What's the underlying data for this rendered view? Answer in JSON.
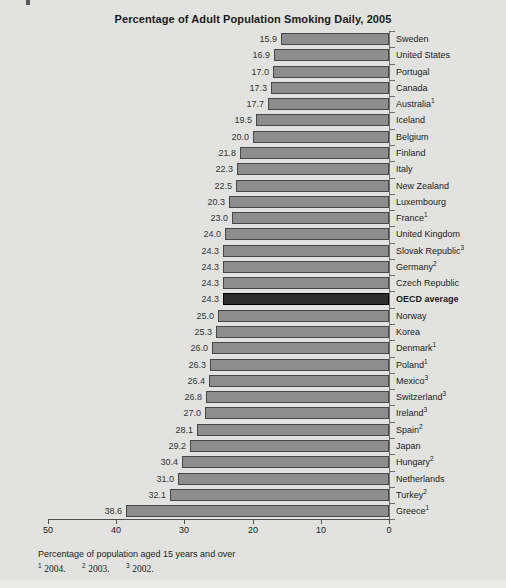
{
  "colors": {
    "background": "#e2e3e0",
    "bar_fill": "#8d8d8d",
    "bar_border": "#474747",
    "highlight_fill": "#2d2d2d",
    "highlight_border": "#000000",
    "axis_line": "#4f4f4f",
    "tick": "#6e6e6e",
    "text": "#1a1a1a",
    "value_text": "#333333",
    "strip": "#ebecea",
    "artifact": "#5a5a5a"
  },
  "footnote_refs": [
    {
      "marker": "1",
      "year": "2004."
    },
    {
      "marker": "2",
      "year": "2003."
    },
    {
      "marker": "3",
      "year": "2002."
    }
  ],
  "chart_data": {
    "type": "bar",
    "orientation": "horizontal",
    "title": "Percentage of Adult Population Smoking Daily, 2005",
    "xlabel": "Percentage of population aged 15 years and over",
    "xlim": [
      0,
      50
    ],
    "x_ticks": [
      50,
      40,
      30,
      20,
      10,
      0
    ],
    "value_axis_note": "zero at right, values increase leftward",
    "legend": "none",
    "grid": "off",
    "rows": [
      {
        "label": "Sweden",
        "sup": "",
        "value": "15.9",
        "bar": 15.9,
        "highlight": false
      },
      {
        "label": "United States",
        "sup": "",
        "value": "16.9",
        "bar": 16.9,
        "highlight": false
      },
      {
        "label": "Portugal",
        "sup": "",
        "value": "17.0",
        "bar": 17.0,
        "highlight": false
      },
      {
        "label": "Canada",
        "sup": "",
        "value": "17.3",
        "bar": 17.3,
        "highlight": false
      },
      {
        "label": "Australia",
        "sup": "1",
        "value": "17.7",
        "bar": 17.7,
        "highlight": false
      },
      {
        "label": "Iceland",
        "sup": "",
        "value": "19.5",
        "bar": 19.5,
        "highlight": false
      },
      {
        "label": "Belgium",
        "sup": "",
        "value": "20.0",
        "bar": 20.0,
        "highlight": false
      },
      {
        "label": "Finland",
        "sup": "",
        "value": "21.8",
        "bar": 21.8,
        "highlight": false
      },
      {
        "label": "Italy",
        "sup": "",
        "value": "22.3",
        "bar": 22.3,
        "highlight": false
      },
      {
        "label": "New Zealand",
        "sup": "",
        "value": "22.5",
        "bar": 22.5,
        "highlight": false
      },
      {
        "label": "Luxembourg",
        "sup": "",
        "value": "20.3",
        "bar": 23.4,
        "highlight": false
      },
      {
        "label": "France",
        "sup": "1",
        "value": "23.0",
        "bar": 23.0,
        "highlight": false
      },
      {
        "label": "United Kingdom",
        "sup": "",
        "value": "24.0",
        "bar": 24.0,
        "highlight": false
      },
      {
        "label": "Slovak Republic",
        "sup": "3",
        "value": "24.3",
        "bar": 24.3,
        "highlight": false
      },
      {
        "label": "Germany",
        "sup": "2",
        "value": "24.3",
        "bar": 24.3,
        "highlight": false
      },
      {
        "label": "Czech Republic",
        "sup": "",
        "value": "24.3",
        "bar": 24.3,
        "highlight": false
      },
      {
        "label": "OECD average",
        "sup": "",
        "value": "24.3",
        "bar": 24.3,
        "highlight": true
      },
      {
        "label": "Norway",
        "sup": "",
        "value": "25.0",
        "bar": 25.0,
        "highlight": false
      },
      {
        "label": "Korea",
        "sup": "",
        "value": "25.3",
        "bar": 25.3,
        "highlight": false
      },
      {
        "label": "Denmark",
        "sup": "1",
        "value": "26.0",
        "bar": 26.0,
        "highlight": false
      },
      {
        "label": "Poland",
        "sup": "1",
        "value": "26.3",
        "bar": 26.3,
        "highlight": false
      },
      {
        "label": "Mexico",
        "sup": "3",
        "value": "26.4",
        "bar": 26.4,
        "highlight": false
      },
      {
        "label": "Switzerland",
        "sup": "3",
        "value": "26.8",
        "bar": 26.8,
        "highlight": false
      },
      {
        "label": "Ireland",
        "sup": "3",
        "value": "27.0",
        "bar": 27.0,
        "highlight": false
      },
      {
        "label": "Spain",
        "sup": "2",
        "value": "28.1",
        "bar": 28.1,
        "highlight": false
      },
      {
        "label": "Japan",
        "sup": "",
        "value": "29.2",
        "bar": 29.2,
        "highlight": false
      },
      {
        "label": "Hungary",
        "sup": "2",
        "value": "30.4",
        "bar": 30.4,
        "highlight": false
      },
      {
        "label": "Netherlands",
        "sup": "",
        "value": "31.0",
        "bar": 31.0,
        "highlight": false
      },
      {
        "label": "Turkey",
        "sup": "2",
        "value": "32.1",
        "bar": 32.1,
        "highlight": false
      },
      {
        "label": "Greece",
        "sup": "1",
        "value": "38.6",
        "bar": 38.6,
        "highlight": false
      }
    ]
  }
}
